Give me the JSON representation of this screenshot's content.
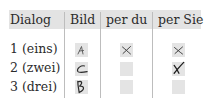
{
  "table": {
    "headers": [
      "Dialog",
      "Bild",
      "per du",
      "per Sie"
    ],
    "header_bg": "#e3e3e3",
    "rows": [
      {
        "dialog": "1 (eins)",
        "bild": "A",
        "per_du": "x-mark",
        "per_sie": "x-mark"
      },
      {
        "dialog": "2 (zwei)",
        "bild": "C",
        "per_du": "",
        "per_sie": "x-mark-bold"
      },
      {
        "dialog": "3 (drei)",
        "bild": "B",
        "per_du": "",
        "per_sie": ""
      }
    ]
  }
}
